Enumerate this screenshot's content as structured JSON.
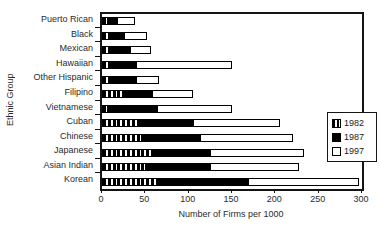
{
  "chart_data": {
    "type": "bar",
    "orientation": "horizontal",
    "overlay": true,
    "title": "",
    "xlabel": "Number of Firms per 1000",
    "ylabel": "Ethnic Group",
    "xlim": [
      0,
      300
    ],
    "xticks": [
      0,
      50,
      100,
      150,
      200,
      250,
      300
    ],
    "grid": false,
    "legend_position": "inside-right",
    "categories": [
      "Puerto Rican",
      "Black",
      "Mexican",
      "Hawaiian",
      "Other Hispanic",
      "Filipino",
      "Vietnamese",
      "Cuban",
      "Chinese",
      "Japanese",
      "Asian Indian",
      "Korean"
    ],
    "series": [
      {
        "name": "1982",
        "style": "black-vertical-stripes",
        "values": [
          7,
          9,
          10,
          11,
          12,
          26,
          7,
          41,
          49,
          59,
          51,
          66
        ]
      },
      {
        "name": "1987",
        "style": "solid-black",
        "values": [
          18,
          26,
          34,
          40,
          40,
          59,
          65,
          106,
          114,
          126,
          126,
          170
        ]
      },
      {
        "name": "1997",
        "style": "white-outlined",
        "values": [
          38,
          52,
          56,
          150,
          66,
          105,
          150,
          205,
          220,
          233,
          227,
          296
        ]
      }
    ],
    "colors": {
      "series_1982_fill": "#000000",
      "series_1982_stripe": "#ffffff",
      "series_1987_fill": "#000000",
      "series_1997_fill": "#ffffff",
      "outline": "#000000",
      "background": "#ffffff",
      "text": "#2b2b2b"
    }
  }
}
